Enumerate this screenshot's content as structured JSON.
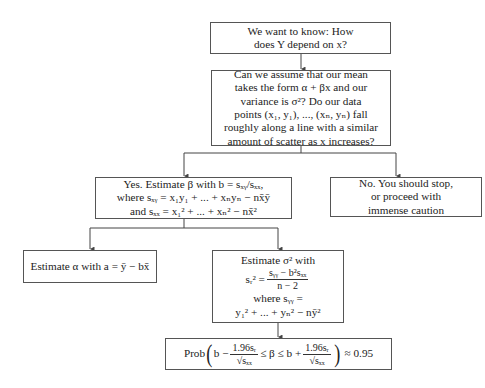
{
  "diagram": {
    "type": "flowchart",
    "nodes": [
      {
        "id": "question",
        "lines": [
          "We want to know: How",
          "does Y depend on x?"
        ]
      },
      {
        "id": "assumptions",
        "lines": [
          "Can we assume that our mean",
          "takes the form α + βx and our",
          "variance is σ²? Do our data",
          "points (x₁, y₁), ..., (xₙ, yₙ) fall",
          "roughly along a line with a similar",
          "amount of scatter as x increases?"
        ]
      },
      {
        "id": "yes",
        "lines": [
          "Yes.  Estimate β with b = sₓᵧ/sₓₓ,",
          "where sₓᵧ = x₁y₁ + ... + xₙyₙ − nx̄ȳ",
          "and sₓₓ = x₁² + ... + xₙ² − nx̄²"
        ]
      },
      {
        "id": "no",
        "lines": [
          "No.  You should stop,",
          "or proceed with",
          "immense caution"
        ]
      },
      {
        "id": "alpha",
        "lines": [
          "Estimate α with a = ȳ − bx̄"
        ]
      },
      {
        "id": "sigma",
        "title": "Estimate σ² with",
        "lhs": "sᵣ²  =",
        "num": "sᵧᵧ − b²sₓₓ",
        "den": "n − 2",
        "where": "where sᵧᵧ  =",
        "expr": "y₁² + ... + yₙ² − nȳ²"
      },
      {
        "id": "ci",
        "prob": "Prob",
        "b1": "b −",
        "num1": "1.96sᵣ",
        "den1": "√sₓₓ",
        "mid": "≤ β ≤ b +",
        "num2": "1.96sᵣ",
        "den2": "√sₓₓ",
        "approx": "≈ 0.95"
      }
    ],
    "edges": [
      {
        "from": "question",
        "to": "assumptions"
      },
      {
        "from": "assumptions",
        "to": "yes"
      },
      {
        "from": "assumptions",
        "to": "no"
      },
      {
        "from": "yes",
        "to": "alpha"
      },
      {
        "from": "yes",
        "to": "sigma"
      },
      {
        "from": "sigma",
        "to": "ci"
      }
    ],
    "colors": {
      "border": "#555555",
      "line": "#444444",
      "background": "#ffffff"
    }
  }
}
